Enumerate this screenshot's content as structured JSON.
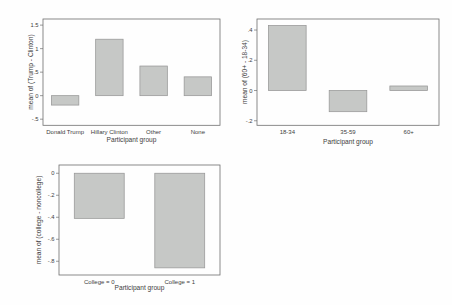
{
  "page": {
    "background": "#fefefe"
  },
  "colors": {
    "bar_fill": "#c6c8c6",
    "bar_border": "#979797",
    "axis_line": "#6e6e6e",
    "text": "#3d3d3d"
  },
  "chart_data": [
    {
      "type": "bar",
      "title": "",
      "xlabel": "Participant group",
      "ylabel": "mean of (Trump - Clinton)",
      "categories": [
        "Donald Trump",
        "Hillary Clinton",
        "Other",
        "None"
      ],
      "values": [
        -0.2,
        1.2,
        0.63,
        0.4
      ],
      "ylim": [
        -0.63,
        1.63
      ],
      "yticks": [
        {
          "v": 1.5,
          "label": "1.5"
        },
        {
          "v": 1.0,
          "label": "1"
        },
        {
          "v": 0.5,
          "label": ".5"
        },
        {
          "v": 0.0,
          "label": "0"
        },
        {
          "v": -0.5,
          "label": "-.5"
        }
      ],
      "grid": false,
      "legend": "none",
      "bar_width_frac": 0.62
    },
    {
      "type": "bar",
      "title": "",
      "xlabel": "Participant group",
      "ylabel": "mean of (60+ - 18-34)",
      "categories": [
        "18-34",
        "35-59",
        "60+"
      ],
      "values": [
        0.43,
        -0.14,
        0.03
      ],
      "ylim": [
        -0.23,
        0.473
      ],
      "yticks": [
        {
          "v": 0.4,
          "label": ".4"
        },
        {
          "v": 0.2,
          "label": ".2"
        },
        {
          "v": 0.0,
          "label": "0"
        },
        {
          "v": -0.2,
          "label": "-.2"
        }
      ],
      "grid": false,
      "legend": "none",
      "bar_width_frac": 0.62
    },
    {
      "type": "bar",
      "title": "",
      "xlabel": "Participant group",
      "ylabel": "mean of (college - noncollege)",
      "categories": [
        "College = 0",
        "College = 1"
      ],
      "values": [
        -0.41,
        -0.86
      ],
      "ylim": [
        -0.925,
        0.075
      ],
      "yticks": [
        {
          "v": 0.0,
          "label": "0"
        },
        {
          "v": -0.2,
          "label": "-.2"
        },
        {
          "v": -0.4,
          "label": "-.4"
        },
        {
          "v": -0.6,
          "label": "-.6"
        },
        {
          "v": -0.8,
          "label": "-.8"
        }
      ],
      "grid": false,
      "legend": "none",
      "bar_width_frac": 0.62
    }
  ]
}
